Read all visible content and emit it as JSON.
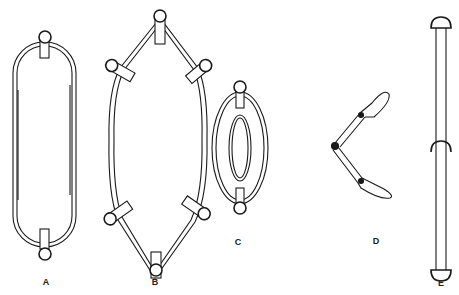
{
  "figure": {
    "labels": {
      "a": "A",
      "b": "B",
      "c": "C",
      "d": "D",
      "e": "E"
    },
    "colors": {
      "stroke": "#1a1a1a",
      "background": "#ffffff"
    }
  }
}
